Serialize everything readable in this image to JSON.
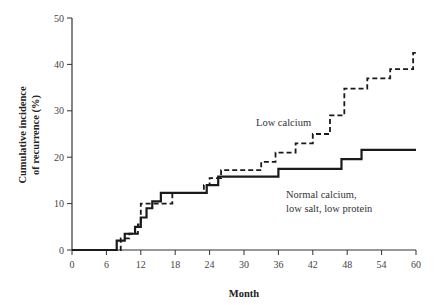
{
  "chart_data": {
    "type": "line",
    "subtype": "step",
    "title": "",
    "xlabel": "Month",
    "ylabel": "Cumulative incidence of recurrence (%)",
    "ylabel_lines": [
      "Cumulative incidence",
      "of recurrence (%)"
    ],
    "xlim": [
      0,
      60
    ],
    "ylim": [
      0,
      50
    ],
    "xticks": [
      0,
      6,
      12,
      18,
      24,
      30,
      36,
      42,
      48,
      54,
      60
    ],
    "yticks": [
      0,
      10,
      20,
      30,
      40,
      50
    ],
    "grid": false,
    "legend": "inline annotations",
    "series": [
      {
        "name": "Normal calcium, low salt, low protein",
        "style": "solid",
        "x": [
          0,
          7.8,
          9.2,
          11.0,
          12.0,
          13.0,
          14.0,
          15.5,
          23.5,
          25.5,
          36.0,
          47.0,
          50.5,
          60
        ],
        "values": [
          0,
          2.0,
          3.5,
          5.0,
          7.0,
          9.0,
          10.5,
          12.3,
          14.0,
          15.8,
          17.5,
          19.6,
          21.6,
          21.6
        ]
      },
      {
        "name": "Low calcium",
        "style": "dashed",
        "x": [
          0,
          8.5,
          10.0,
          11.5,
          12.0,
          17.5,
          23.0,
          24.0,
          26.0,
          33.0,
          35.5,
          39.0,
          42.0,
          45.0,
          47.5,
          51.5,
          55.5,
          59.5,
          60
        ],
        "values": [
          0,
          2.5,
          3.5,
          5.5,
          10.0,
          12.3,
          14.0,
          15.5,
          17.2,
          19.0,
          21.0,
          23.0,
          25.0,
          29.0,
          34.8,
          37.0,
          39.0,
          42.5,
          42.5
        ]
      }
    ],
    "annotations": [
      {
        "text": "Low calcium",
        "series": "Low calcium"
      },
      {
        "text_lines": [
          "Normal calcium,",
          "low salt, low protein"
        ],
        "series": "Normal calcium, low salt, low protein"
      }
    ]
  },
  "labels": {
    "xlabel": "Month",
    "ylabel_line1": "Cumulative incidence",
    "ylabel_line2": "of recurrence (%)",
    "annot_low": "Low calcium",
    "annot_normal_line1": "Normal calcium,",
    "annot_normal_line2": "low salt, low protein"
  }
}
